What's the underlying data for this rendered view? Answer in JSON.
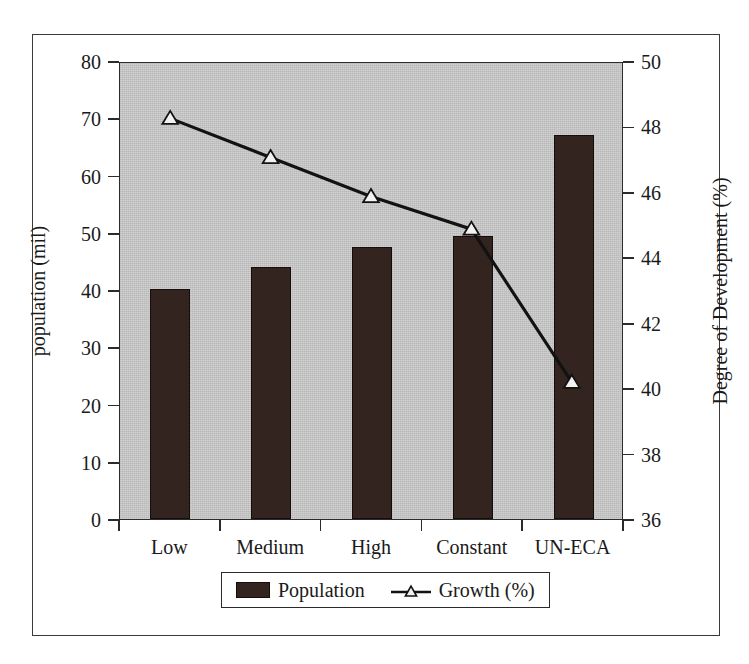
{
  "chart_data": {
    "type": "bar",
    "title": "",
    "subtitle": "",
    "categories": [
      "Low",
      "Medium",
      "High",
      "Constant",
      "UN-ECA"
    ],
    "xlabel": "",
    "grid": false,
    "legend_position": "bottom",
    "series": [
      {
        "name": "Population",
        "type": "bar",
        "axis": "left",
        "unit": "mil",
        "color": "#33241f",
        "values": [
          40.1,
          44.0,
          47.5,
          49.5,
          67.0
        ]
      },
      {
        "name": "Growth (%)",
        "type": "line",
        "axis": "right",
        "unit": "%",
        "color": "#121212",
        "marker": "open-triangle",
        "values": [
          48.3,
          47.1,
          45.9,
          44.9,
          40.2
        ]
      }
    ],
    "axes": {
      "left": {
        "label": "population (mil)",
        "min": 0,
        "max": 80,
        "step": 10,
        "ticks": [
          "0",
          "10",
          "20",
          "30",
          "40",
          "50",
          "60",
          "70",
          "80"
        ]
      },
      "right": {
        "label": "Degree of Development (%)",
        "min": 36,
        "max": 50,
        "step": 2,
        "ticks": [
          "36",
          "38",
          "40",
          "42",
          "44",
          "46",
          "48",
          "50"
        ]
      }
    }
  },
  "legend": {
    "items": [
      {
        "label": "Population",
        "marker": "filled-bar-swatch"
      },
      {
        "label": "Growth (%)",
        "marker": "line-open-triangle"
      }
    ]
  },
  "colors": {
    "plot_background": "#c3c3c3",
    "bar_fill": "#33241f",
    "line": "#121212",
    "marker_fill": "#f2f2f0",
    "frame": "#2b2b2b",
    "page_background": "#ffffff"
  }
}
